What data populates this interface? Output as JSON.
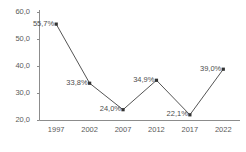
{
  "chart_data": {
    "type": "line",
    "title": "",
    "subtitle": "",
    "xlabel": "",
    "ylabel": "",
    "categories": [
      "1997",
      "2002",
      "2007",
      "2012",
      "2017",
      "2022"
    ],
    "x": [
      1997,
      2002,
      2007,
      2012,
      2017,
      2022
    ],
    "values": [
      55.7,
      33.8,
      24.0,
      34.9,
      22.1,
      39.0
    ],
    "point_labels": [
      "55,7%",
      "33,8%",
      "24,0%",
      "34,9%",
      "22,1%",
      "39,0%"
    ],
    "ylim": [
      20.0,
      60.0
    ],
    "yticks": [
      20.0,
      30.0,
      40.0,
      50.0,
      60.0
    ],
    "ytick_labels": [
      "20,0",
      "30,0",
      "40,0",
      "50,0",
      "60,0"
    ],
    "xtick_labels": [
      "1997",
      "2002",
      "2007",
      "2012",
      "2017",
      "2022"
    ],
    "grid": false,
    "legend": false,
    "legend_position": "none",
    "series": [
      {
        "name": "",
        "values": [
          55.7,
          33.8,
          24.0,
          34.9,
          22.1,
          39.0
        ],
        "line_color": "#555555",
        "marker_color": "#333333",
        "marker": "square"
      }
    ],
    "colors": {
      "background": "#ffffff",
      "axis": "#8c8c8c",
      "line": "#555555",
      "marker": "#333333",
      "text": "#555555"
    }
  },
  "axes": {
    "y_axis_name": "value-axis",
    "x_axis_name": "year-axis"
  }
}
